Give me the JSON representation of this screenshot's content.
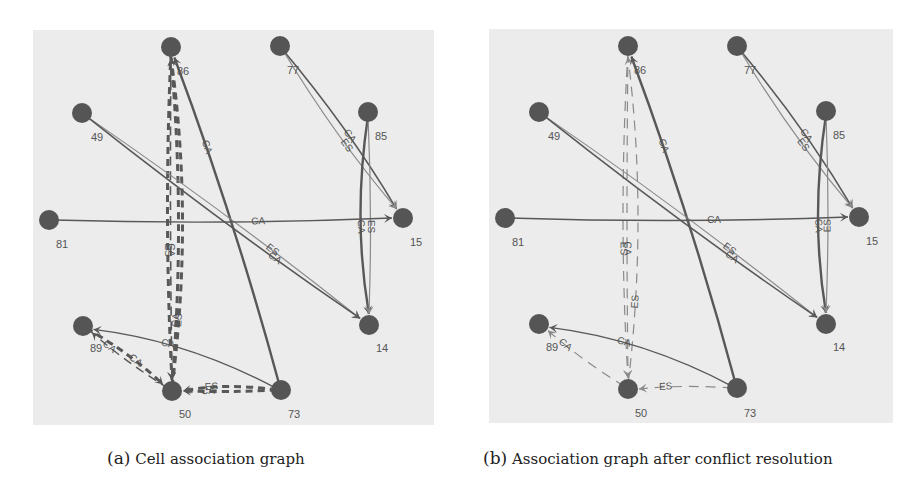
{
  "figure": {
    "background": "#ffffff",
    "panel_bg": "#ececec",
    "node_color": "#555555",
    "edge_dark": "#585858",
    "edge_light": "#8a8a8a",
    "panels": [
      {
        "id": "a",
        "caption_tag": "(a)",
        "caption_text": "Cell association graph",
        "caption_x": 107,
        "rect": {
          "x": 33,
          "y": 30,
          "w": 401,
          "h": 395
        },
        "nodes": [
          {
            "id": "86",
            "x": 171,
            "y": 47,
            "lx": 183,
            "ly": 75
          },
          {
            "id": "77",
            "x": 280,
            "y": 46,
            "lx": 293,
            "ly": 74
          },
          {
            "id": "49",
            "x": 82,
            "y": 113,
            "lx": 97,
            "ly": 141
          },
          {
            "id": "85",
            "x": 368,
            "y": 112,
            "lx": 381,
            "ly": 140
          },
          {
            "id": "81",
            "x": 49,
            "y": 220,
            "lx": 62,
            "ly": 248
          },
          {
            "id": "15",
            "x": 403,
            "y": 218,
            "lx": 416,
            "ly": 246
          },
          {
            "id": "89",
            "x": 83,
            "y": 326,
            "lx": 96,
            "ly": 352
          },
          {
            "id": "14",
            "x": 369,
            "y": 325,
            "lx": 382,
            "ly": 352
          },
          {
            "id": "50",
            "x": 172,
            "y": 391,
            "lx": 185,
            "ly": 418
          },
          {
            "id": "73",
            "x": 281,
            "y": 390,
            "lx": 294,
            "ly": 418
          }
        ],
        "edges": [
          {
            "from": "73",
            "to": "86",
            "label": "CA",
            "style": "solid",
            "weight": 2.4,
            "shade": "dark",
            "curve": 8,
            "lt": 0.72
          },
          {
            "from": "50",
            "to": "86",
            "label": "ES",
            "style": "dashed-thick",
            "weight": 3,
            "shade": "dark",
            "curve": 22,
            "lt": 0.2
          },
          {
            "from": "50",
            "to": "86",
            "label": "CA",
            "style": "dashed-thick",
            "weight": 3,
            "shade": "dark",
            "curve": 14,
            "lt": 0.2
          },
          {
            "from": "86",
            "to": "50",
            "label": "ES",
            "style": "dashed-thick",
            "weight": 3,
            "shade": "dark",
            "curve": 8,
            "lt": 0.6
          },
          {
            "from": "86",
            "to": "50",
            "label": "CA",
            "style": "dashed-thin",
            "weight": 1.6,
            "shade": "dark",
            "curve": 2,
            "lt": 0.6
          },
          {
            "from": "49",
            "to": "14",
            "label": "ES",
            "style": "solid",
            "weight": 1.2,
            "shade": "light",
            "curve": -6,
            "lt": 0.67
          },
          {
            "from": "49",
            "to": "14",
            "label": "CA",
            "style": "solid",
            "weight": 1.6,
            "shade": "dark",
            "curve": 6,
            "lt": 0.69
          },
          {
            "from": "77",
            "to": "15",
            "label": "CA",
            "style": "solid",
            "weight": 1.6,
            "shade": "dark",
            "curve": -8,
            "lt": 0.55
          },
          {
            "from": "77",
            "to": "15",
            "label": "ES",
            "style": "solid",
            "weight": 1.2,
            "shade": "light",
            "curve": 8,
            "lt": 0.58
          },
          {
            "from": "85",
            "to": "14",
            "label": "CA",
            "style": "solid",
            "weight": 2.4,
            "shade": "dark",
            "curve": 16,
            "lt": 0.55
          },
          {
            "from": "85",
            "to": "14",
            "label": "ES",
            "style": "solid",
            "weight": 1.2,
            "shade": "light",
            "curve": -4,
            "lt": 0.55
          },
          {
            "from": "81",
            "to": "15",
            "label": "CA",
            "style": "solid",
            "weight": 1.4,
            "shade": "dark",
            "curve": 6,
            "lt": 0.6
          },
          {
            "from": "73",
            "to": "89",
            "label": "CA",
            "style": "solid",
            "weight": 1.4,
            "shade": "dark",
            "curve": 18,
            "lt": 0.6
          },
          {
            "from": "50",
            "to": "89",
            "label": "CA",
            "style": "dashed-thin",
            "weight": 1.4,
            "shade": "dark",
            "curve": -4,
            "lt": 0.75
          },
          {
            "from": "89",
            "to": "50",
            "label": "CA",
            "style": "dashed-thick",
            "weight": 3,
            "shade": "dark",
            "curve": -6,
            "lt": 0.6
          },
          {
            "from": "73",
            "to": "50",
            "label": "ES",
            "style": "dashed-thick",
            "weight": 3,
            "shade": "dark",
            "curve": 8,
            "lt": 0.68
          },
          {
            "from": "73",
            "to": "50",
            "label": "CA",
            "style": "dashed-thick",
            "weight": 3,
            "shade": "dark",
            "curve": -2,
            "lt": 0.72
          }
        ]
      },
      {
        "id": "b",
        "caption_tag": "(b)",
        "caption_text": "Association graph after conflict resolution",
        "caption_x": 483,
        "rect": {
          "x": 489,
          "y": 29,
          "w": 404,
          "h": 394
        },
        "nodes": [
          {
            "id": "86",
            "x": 628,
            "y": 46,
            "lx": 640,
            "ly": 74
          },
          {
            "id": "77",
            "x": 737,
            "y": 46,
            "lx": 750,
            "ly": 74
          },
          {
            "id": "49",
            "x": 539,
            "y": 112,
            "lx": 554,
            "ly": 140
          },
          {
            "id": "85",
            "x": 826,
            "y": 111,
            "lx": 839,
            "ly": 139
          },
          {
            "id": "81",
            "x": 505,
            "y": 218,
            "lx": 518,
            "ly": 246
          },
          {
            "id": "15",
            "x": 859,
            "y": 217,
            "lx": 872,
            "ly": 245
          },
          {
            "id": "89",
            "x": 539,
            "y": 324,
            "lx": 552,
            "ly": 351
          },
          {
            "id": "14",
            "x": 826,
            "y": 324,
            "lx": 839,
            "ly": 351
          },
          {
            "id": "50",
            "x": 628,
            "y": 389,
            "lx": 641,
            "ly": 417
          },
          {
            "id": "73",
            "x": 737,
            "y": 388,
            "lx": 750,
            "ly": 417
          }
        ],
        "edges": [
          {
            "from": "73",
            "to": "86",
            "label": "CA",
            "style": "solid",
            "weight": 2.4,
            "shade": "dark",
            "curve": 8,
            "lt": 0.72
          },
          {
            "from": "50",
            "to": "86",
            "label": "ES",
            "style": "dashed-light",
            "weight": 1.2,
            "shade": "light",
            "curve": 20,
            "lt": 0.25
          },
          {
            "from": "86",
            "to": "50",
            "label": "ES",
            "style": "dashed-light",
            "weight": 1.2,
            "shade": "light",
            "curve": 10,
            "lt": 0.6
          },
          {
            "from": "86",
            "to": "50",
            "label": "CA",
            "style": "dashed-light",
            "weight": 1.2,
            "shade": "light",
            "curve": 2,
            "lt": 0.6
          },
          {
            "from": "49",
            "to": "14",
            "label": "ES",
            "style": "solid",
            "weight": 1.2,
            "shade": "light",
            "curve": -6,
            "lt": 0.67
          },
          {
            "from": "49",
            "to": "14",
            "label": "CA",
            "style": "solid",
            "weight": 1.6,
            "shade": "dark",
            "curve": 6,
            "lt": 0.69
          },
          {
            "from": "77",
            "to": "15",
            "label": "CA",
            "style": "solid",
            "weight": 1.6,
            "shade": "dark",
            "curve": -8,
            "lt": 0.55
          },
          {
            "from": "77",
            "to": "15",
            "label": "ES",
            "style": "solid",
            "weight": 1.2,
            "shade": "light",
            "curve": 8,
            "lt": 0.58
          },
          {
            "from": "85",
            "to": "14",
            "label": "CA",
            "style": "solid",
            "weight": 2.4,
            "shade": "dark",
            "curve": 16,
            "lt": 0.55
          },
          {
            "from": "85",
            "to": "14",
            "label": "ES",
            "style": "solid",
            "weight": 1.2,
            "shade": "light",
            "curve": -4,
            "lt": 0.55
          },
          {
            "from": "81",
            "to": "15",
            "label": "CA",
            "style": "solid",
            "weight": 1.4,
            "shade": "dark",
            "curve": 6,
            "lt": 0.6
          },
          {
            "from": "73",
            "to": "89",
            "label": "CA",
            "style": "solid",
            "weight": 1.4,
            "shade": "dark",
            "curve": 18,
            "lt": 0.6
          },
          {
            "from": "50",
            "to": "89",
            "label": "CA",
            "style": "dashed-light",
            "weight": 1.2,
            "shade": "light",
            "curve": -4,
            "lt": 0.75
          },
          {
            "from": "73",
            "to": "50",
            "label": "ES",
            "style": "dashed-light",
            "weight": 1.2,
            "shade": "light",
            "curve": 4,
            "lt": 0.7
          }
        ]
      }
    ]
  }
}
